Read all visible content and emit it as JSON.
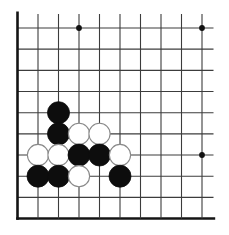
{
  "board": {
    "type": "go-diagram",
    "description": "go-board-corner-position",
    "visible_cols": 10,
    "visible_rows": 10,
    "edges": {
      "left": true,
      "bottom": true,
      "top": false,
      "right": false
    },
    "colors": {
      "background": "#ffffff",
      "grid": "#3c3c3c",
      "edge": "#141414",
      "star": "#111111",
      "black_stone": "#0d0d0d",
      "white_stone": "#ffffff",
      "white_stone_outline": "#8a8a8a"
    },
    "star_points": [
      {
        "col": 4,
        "row": 1
      },
      {
        "col": 10,
        "row": 1
      },
      {
        "col": 10,
        "row": 7
      }
    ],
    "stones": [
      {
        "color": "black",
        "col": 3,
        "row": 5
      },
      {
        "color": "black",
        "col": 3,
        "row": 6
      },
      {
        "color": "white",
        "col": 4,
        "row": 6
      },
      {
        "color": "white",
        "col": 5,
        "row": 6
      },
      {
        "color": "white",
        "col": 2,
        "row": 7
      },
      {
        "color": "white",
        "col": 3,
        "row": 7
      },
      {
        "color": "black",
        "col": 4,
        "row": 7
      },
      {
        "color": "black",
        "col": 5,
        "row": 7
      },
      {
        "color": "white",
        "col": 6,
        "row": 7
      },
      {
        "color": "black",
        "col": 2,
        "row": 8
      },
      {
        "color": "black",
        "col": 3,
        "row": 8
      },
      {
        "color": "white",
        "col": 4,
        "row": 8
      },
      {
        "color": "black",
        "col": 6,
        "row": 8
      }
    ]
  }
}
